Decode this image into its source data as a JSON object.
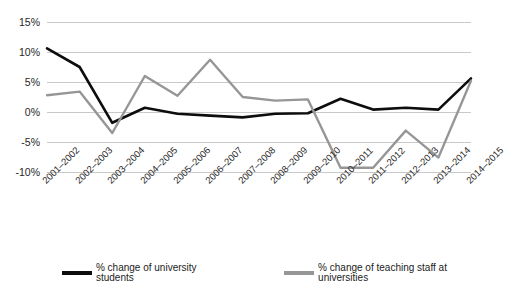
{
  "chart_data": {
    "type": "line",
    "title": "",
    "xlabel": "",
    "ylabel": "",
    "ylim": [
      -10,
      15
    ],
    "yticks": [
      15,
      10,
      5,
      0,
      -5,
      -10
    ],
    "ytick_labels": [
      "15%",
      "10%",
      "5%",
      "0%",
      "-5%",
      "-10%"
    ],
    "grid": true,
    "legend_position": "bottom",
    "categories": [
      "2001–2002",
      "2002–2003",
      "2003–2004",
      "2004–2005",
      "2005–2006",
      "2006–2007",
      "2007–2008",
      "2008–2009",
      "2009–2010",
      "2010–2011",
      "2011–2012",
      "2012–2013",
      "2013–2014",
      "2014–2015"
    ],
    "series": [
      {
        "name": "% change of university students",
        "color": "#0d0d0d",
        "values": [
          10.6,
          7.5,
          -1.8,
          0.7,
          -0.3,
          -0.6,
          -0.9,
          -0.3,
          -0.2,
          2.2,
          0.4,
          0.7,
          0.4,
          5.6
        ]
      },
      {
        "name": "% change of teaching staff at universities",
        "color": "#969696",
        "values": [
          2.8,
          3.4,
          -3.5,
          6.0,
          2.7,
          8.7,
          2.5,
          1.9,
          2.1,
          -9.3,
          -9.3,
          -3.1,
          -7.6,
          5.2
        ]
      }
    ]
  },
  "legend": {
    "items": [
      {
        "label": "% change of university students",
        "color": "#0d0d0d"
      },
      {
        "label": "% change of teaching staff at universities",
        "color": "#969696"
      }
    ]
  }
}
